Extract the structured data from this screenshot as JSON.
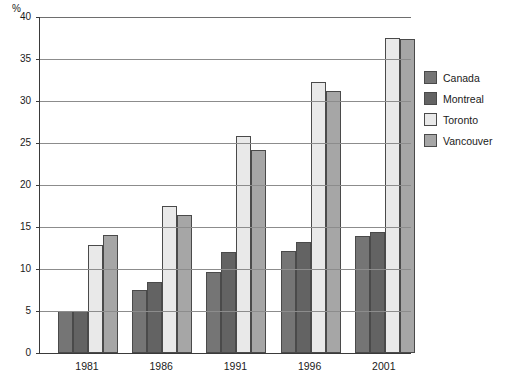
{
  "chart_data": {
    "type": "bar",
    "title": "",
    "subtitle": "",
    "xlabel": "",
    "ylabel": "%",
    "unit_label": "%",
    "categories": [
      "1981",
      "1986",
      "1991",
      "1996",
      "2001"
    ],
    "series": [
      {
        "name": "Canada",
        "color": "#757575",
        "values": [
          5.0,
          7.5,
          9.7,
          12.1,
          13.9
        ]
      },
      {
        "name": "Montreal",
        "color": "#636363",
        "values": [
          5.0,
          8.4,
          12.0,
          13.2,
          14.4
        ]
      },
      {
        "name": "Toronto",
        "color": "#e9e9e9",
        "values": [
          12.9,
          17.5,
          25.8,
          32.3,
          37.5
        ]
      },
      {
        "name": "Vancouver",
        "color": "#a6a6a6",
        "values": [
          14.0,
          16.4,
          24.2,
          31.2,
          37.4
        ]
      }
    ],
    "ylim": [
      0,
      40
    ],
    "yticks": [
      0,
      5,
      10,
      15,
      20,
      25,
      30,
      35,
      40
    ],
    "ytick_labels": [
      "0",
      "5",
      "10",
      "15",
      "20",
      "25",
      "30",
      "35",
      "40"
    ],
    "grid": true,
    "grid_axis": "y",
    "legend_position": "right",
    "legend_entries": [
      "Canada",
      "Montreal",
      "Toronto",
      "Vancouver"
    ]
  },
  "footnote": ""
}
